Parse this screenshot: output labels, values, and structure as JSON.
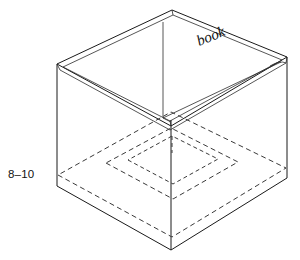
{
  "figure": {
    "background_color": "#ffffff",
    "line_color": "#1a1a1a",
    "hidden_line_color": "#3a3a3a",
    "labels": {
      "dimension": "8–10",
      "part": "book"
    },
    "geometry": {
      "projection": "isometric",
      "outer_top_apex": [
        172,
        10
      ],
      "outer_top_left": [
        57,
        64
      ],
      "outer_top_right": [
        287,
        57
      ],
      "outer_front_bottom": [
        172,
        250
      ],
      "outer_left_bottom": [
        57,
        186
      ],
      "outer_right_bottom": [
        287,
        178
      ],
      "inner_front_corner": [
        170,
        118
      ],
      "inner_back_corner": [
        163,
        22
      ],
      "rim_thickness_px": 5,
      "hidden_base_outer": [
        [
          58,
          175
        ],
        [
          172,
          237
        ],
        [
          286,
          168
        ],
        [
          171,
          112
        ]
      ],
      "hidden_base_middle": [
        [
          106,
          163
        ],
        [
          173,
          199
        ],
        [
          238,
          162
        ],
        [
          171,
          128
        ]
      ],
      "hidden_base_inner": [
        [
          128,
          160
        ],
        [
          173,
          184
        ],
        [
          218,
          159
        ],
        [
          172,
          136
        ]
      ],
      "hidden_riser": [
        [
          172,
          136
        ],
        [
          172,
          152
        ]
      ]
    }
  }
}
